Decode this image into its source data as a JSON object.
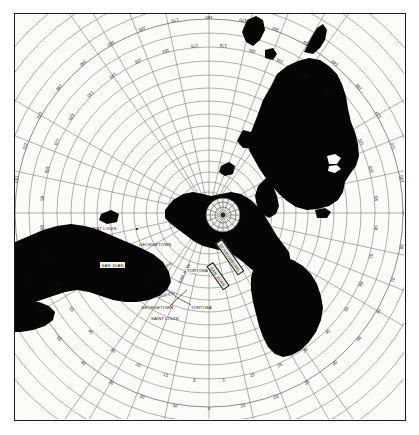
{
  "figure": {
    "kind": "azimuthal-equidistant-great-circle-chart",
    "background_color": "#fbfbf8",
    "land_color": "#000000",
    "graticule_color": "#6b6b6b",
    "frame_color": "#1c1c1c",
    "center_marker": "compass-rose"
  },
  "chart_data": {
    "type": "scatter",
    "title": "",
    "xlabel": "",
    "ylabel": "",
    "projection": "azimuthal equidistant",
    "grid": true,
    "legend": "none",
    "azimuth_ring": {
      "units": "degrees",
      "start": 0,
      "end": 180,
      "step": 5,
      "mirrored_both_sides": true,
      "labels": [
        "0",
        "5",
        "10",
        "15",
        "20",
        "25",
        "30",
        "35",
        "40",
        "45",
        "50",
        "55",
        "60",
        "65",
        "70",
        "75",
        "80",
        "85",
        "90",
        "95",
        "100",
        "105",
        "110",
        "115",
        "120",
        "125",
        "130",
        "135",
        "140",
        "145",
        "150",
        "155",
        "160",
        "165",
        "170",
        "175",
        "180"
      ]
    },
    "range_rings": {
      "count": 18,
      "note": "concentric distance circles from the centre"
    },
    "stations": [
      {
        "name": "SAINT LOUIS",
        "placement": "left-upper",
        "style": "plain"
      },
      {
        "name": "GEORGETOWN",
        "placement": "left-inner",
        "style": "plain"
      },
      {
        "name": "SAN JUAN",
        "placement": "left-boxed",
        "style": "boxed"
      },
      {
        "name": "SCHAUMBURG",
        "placement": "centre-lower-left",
        "style": "rotated"
      },
      {
        "name": "SAN JUAN",
        "placement": "centre-lower",
        "style": "rotated"
      },
      {
        "name": "ZURICH",
        "placement": "centre-lower",
        "style": "plain"
      },
      {
        "name": "GEORGETOWN",
        "placement": "centre-bottom",
        "style": "plain"
      },
      {
        "name": "TORTOSA",
        "placement": "centre-bottom-right",
        "style": "plain"
      },
      {
        "name": "SAINT LOUIS",
        "placement": "centre-bottom",
        "style": "plain"
      },
      {
        "name": "TORTOSA",
        "placement": "centre-right",
        "style": "plain"
      },
      {
        "name": "SCHAUMBURG",
        "placement": "ribbon-diagonal-upper",
        "style": "ribbon"
      },
      {
        "name": "SAN JUAN",
        "placement": "ribbon-diagonal-lower",
        "style": "ribbon"
      }
    ]
  },
  "ring_labels": {
    "top_arc": [
      "180",
      "175",
      "170",
      "165",
      "160",
      "155",
      "150",
      "145",
      "140",
      "135",
      "130",
      "125",
      "120",
      "115",
      "110",
      "105",
      "100"
    ],
    "bottom_arc": [
      "0",
      "5",
      "10",
      "15",
      "20",
      "25",
      "30",
      "35",
      "40",
      "45",
      "50",
      "55",
      "60",
      "65",
      "70",
      "75",
      "80",
      "85",
      "90",
      "95"
    ],
    "left_side": [
      "100",
      "95",
      "90",
      "85",
      "80",
      "75",
      "70",
      "65",
      "60"
    ],
    "right_side": [
      "100",
      "95",
      "90",
      "85",
      "80",
      "75",
      "70",
      "65",
      "60"
    ]
  },
  "city_labels": {
    "saint_louis_upper": "SAINT LOUIS",
    "georgetown_upper": "GEORGETOWN",
    "san_juan_box": "SAN JUAN",
    "schaumburg": "SCHAUMBURG",
    "san_juan_inner": "SAN JUAN",
    "zurich": "ZURICH",
    "georgetown_lower": "GEORGETOWN",
    "tortosa_lower": "TORTOSA",
    "saint_louis_lower": "SAINT LOUIS",
    "tortosa_mid": "TORTOSA",
    "ribbon_upper": "SCHAUMBURG",
    "ribbon_lower": "SAN JUAN"
  }
}
